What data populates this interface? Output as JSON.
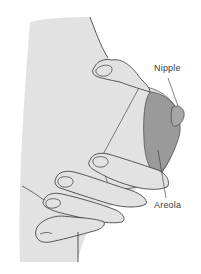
{
  "diagram": {
    "labels": {
      "nipple": "Nipple",
      "areola": "Areola"
    },
    "colors": {
      "skin": "#e2e2e2",
      "areola": "#9a9a9a",
      "outline": "#333333",
      "background": "#ffffff"
    }
  }
}
